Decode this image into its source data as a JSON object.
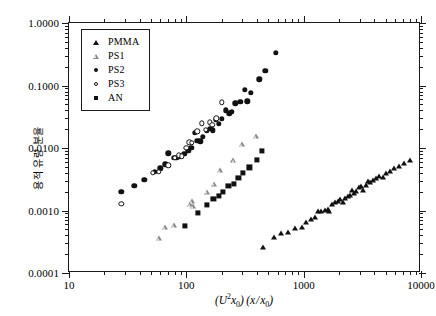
{
  "chart_data": {
    "type": "scatter",
    "title": "",
    "xlabel": "(U²x₀)(x/x₀)",
    "ylabel": "용적 유량 분율",
    "xscale": "log",
    "yscale": "log",
    "xlim": [
      10,
      10000
    ],
    "ylim": [
      0.0001,
      1.0
    ],
    "grid": false,
    "legend_position": "top-left",
    "xticks": [
      "10",
      "100",
      "1000",
      "10000"
    ],
    "xtick_values": [
      10,
      100,
      1000,
      10000
    ],
    "yticks": [
      "1.0000",
      "0.1000",
      "0.0100",
      "0.0010",
      "0.0001"
    ],
    "ytick_values": [
      1.0,
      0.1,
      0.01,
      0.001,
      0.0001
    ],
    "series": [
      {
        "name": "PMMA",
        "marker": "filled-triangle",
        "color": "#111111",
        "points": [
          [
            450,
            0.00026
          ],
          [
            560,
            0.00038
          ],
          [
            640,
            0.00044
          ],
          [
            730,
            0.00046
          ],
          [
            850,
            0.00052
          ],
          [
            960,
            0.00055
          ],
          [
            1040,
            0.00066
          ],
          [
            1150,
            0.00072
          ],
          [
            1240,
            0.00078
          ],
          [
            1320,
            0.00098
          ],
          [
            1400,
            0.001
          ],
          [
            1520,
            0.00102
          ],
          [
            1600,
            0.00105
          ],
          [
            1660,
            0.00099
          ],
          [
            1740,
            0.00128
          ],
          [
            1860,
            0.00135
          ],
          [
            1980,
            0.0014
          ],
          [
            2060,
            0.0015
          ],
          [
            2180,
            0.00139
          ],
          [
            2260,
            0.0016
          ],
          [
            2380,
            0.00168
          ],
          [
            2480,
            0.00175
          ],
          [
            2560,
            0.00215
          ],
          [
            2700,
            0.00192
          ],
          [
            2820,
            0.00205
          ],
          [
            2960,
            0.0024
          ],
          [
            3080,
            0.0025
          ],
          [
            3200,
            0.00215
          ],
          [
            3380,
            0.00255
          ],
          [
            3520,
            0.003
          ],
          [
            3700,
            0.0029
          ],
          [
            3900,
            0.0031
          ],
          [
            4150,
            0.0033
          ],
          [
            4400,
            0.00355
          ],
          [
            4700,
            0.0034
          ],
          [
            5000,
            0.004
          ],
          [
            5400,
            0.0043
          ],
          [
            5900,
            0.0047
          ],
          [
            6500,
            0.0052
          ],
          [
            7200,
            0.0057
          ],
          [
            8000,
            0.0064
          ]
        ]
      },
      {
        "name": "PS1",
        "marker": "open-triangle",
        "color": "#888888",
        "points": [
          [
            58,
            0.00036
          ],
          [
            66,
            0.00055
          ],
          [
            78,
            0.00058
          ],
          [
            108,
            0.00125
          ],
          [
            112,
            0.0014
          ],
          [
            113,
            0.00118
          ],
          [
            150,
            0.002
          ],
          [
            172,
            0.0027
          ],
          [
            195,
            0.0044
          ],
          [
            252,
            0.0064
          ],
          [
            300,
            0.0115
          ],
          [
            395,
            0.0155
          ]
        ]
      },
      {
        "name": "PS2",
        "marker": "filled-circle",
        "color": "#111111",
        "points": [
          [
            28,
            0.002
          ],
          [
            36,
            0.0025
          ],
          [
            44,
            0.0031
          ],
          [
            54,
            0.0042
          ],
          [
            60,
            0.0047
          ],
          [
            66,
            0.00545
          ],
          [
            70,
            0.0082
          ],
          [
            78,
            0.0069
          ],
          [
            82,
            0.007
          ],
          [
            88,
            0.0074
          ],
          [
            96,
            0.008
          ],
          [
            104,
            0.0091
          ],
          [
            110,
            0.01
          ],
          [
            118,
            0.0175
          ],
          [
            124,
            0.013
          ],
          [
            132,
            0.0128
          ],
          [
            138,
            0.015
          ],
          [
            150,
            0.019
          ],
          [
            160,
            0.0205
          ],
          [
            168,
            0.0192
          ],
          [
            178,
            0.028
          ],
          [
            190,
            0.0245
          ],
          [
            200,
            0.029
          ],
          [
            218,
            0.04
          ],
          [
            232,
            0.036
          ],
          [
            245,
            0.038
          ],
          [
            262,
            0.052
          ],
          [
            288,
            0.055
          ],
          [
            315,
            0.085
          ],
          [
            330,
            0.056
          ],
          [
            355,
            0.076
          ],
          [
            420,
            0.125
          ],
          [
            470,
            0.17
          ],
          [
            580,
            0.33
          ]
        ]
      },
      {
        "name": "PS3",
        "marker": "open-circle",
        "color": "#111111",
        "points": [
          [
            28,
            0.00128
          ],
          [
            52,
            0.004
          ],
          [
            58,
            0.0042
          ],
          [
            70,
            0.0053
          ],
          [
            80,
            0.007
          ],
          [
            86,
            0.0076
          ],
          [
            92,
            0.0074
          ],
          [
            100,
            0.01
          ],
          [
            106,
            0.0123
          ],
          [
            112,
            0.012
          ],
          [
            124,
            0.0185
          ],
          [
            136,
            0.025
          ],
          [
            146,
            0.0195
          ],
          [
            158,
            0.0258
          ],
          [
            166,
            0.0235
          ],
          [
            180,
            0.03
          ],
          [
            200,
            0.054
          ]
        ]
      },
      {
        "name": "AN",
        "marker": "filled-square",
        "color": "#111111",
        "points": [
          [
            98,
            0.00056
          ],
          [
            125,
            0.00092
          ],
          [
            150,
            0.00122
          ],
          [
            170,
            0.00155
          ],
          [
            190,
            0.0017
          ],
          [
            205,
            0.002
          ],
          [
            228,
            0.00245
          ],
          [
            255,
            0.00265
          ],
          [
            278,
            0.0033
          ],
          [
            305,
            0.004
          ],
          [
            345,
            0.0049
          ],
          [
            400,
            0.0064
          ],
          [
            440,
            0.009
          ]
        ]
      }
    ]
  },
  "legend": {
    "items": [
      {
        "label": "PMMA",
        "marker": "filled-triangle"
      },
      {
        "label": "PS1",
        "marker": "open-triangle"
      },
      {
        "label": "PS2",
        "marker": "filled-circle"
      },
      {
        "label": "PS3",
        "marker": "open-circle"
      },
      {
        "label": "AN",
        "marker": "filled-square"
      }
    ]
  },
  "axes": {
    "y_title": "용적 유량 분율",
    "x_title_plain": "(U2x0)(x/x0)"
  }
}
